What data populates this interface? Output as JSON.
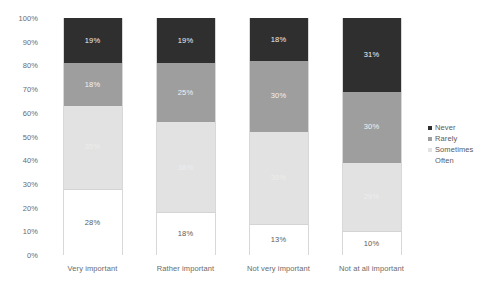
{
  "chart_data": {
    "type": "bar",
    "title": "",
    "subtitle": "",
    "xlabel": "",
    "ylabel": "",
    "ylim": [
      0,
      100
    ],
    "stacked": true,
    "normalized_percent": true,
    "grid": false,
    "legend_position": "right",
    "categories": [
      "Very important",
      "Rather important",
      "Not very important",
      "Not at all important"
    ],
    "y_ticks": [
      "0%",
      "10%",
      "20%",
      "30%",
      "40%",
      "50%",
      "60%",
      "70%",
      "80%",
      "90%",
      "100%"
    ],
    "y_tick_values": [
      0,
      10,
      20,
      30,
      40,
      50,
      60,
      70,
      80,
      90,
      100
    ],
    "stack_order_bottom_to_top": [
      "Often",
      "Sometimes",
      "Rarely",
      "Never"
    ],
    "series": [
      {
        "name": "Never",
        "color": "#2f2f2f",
        "values": [
          19,
          19,
          18,
          31
        ],
        "labels": [
          "19%",
          "19%",
          "18%",
          "31%"
        ]
      },
      {
        "name": "Rarely",
        "color": "#9e9e9e",
        "values": [
          18,
          25,
          30,
          30
        ],
        "labels": [
          "18%",
          "25%",
          "30%",
          "30%"
        ]
      },
      {
        "name": "Sometimes",
        "color": "#e2e2e2",
        "values": [
          35,
          38,
          39,
          29
        ],
        "labels": [
          "35%",
          "38%",
          "39%",
          "29%"
        ]
      },
      {
        "name": "Often",
        "color": "#ffffff",
        "values": [
          28,
          18,
          13,
          10
        ],
        "labels": [
          "28%",
          "18%",
          "13%",
          "10%"
        ]
      }
    ]
  },
  "legend": {
    "items": [
      {
        "label": "Never",
        "color": "#2f2f2f"
      },
      {
        "label": "Rarely",
        "color": "#9e9e9e"
      },
      {
        "label": "Sometimes",
        "color": "#e2e2e2"
      },
      {
        "label": "Often",
        "color": "#ffffff"
      }
    ]
  }
}
